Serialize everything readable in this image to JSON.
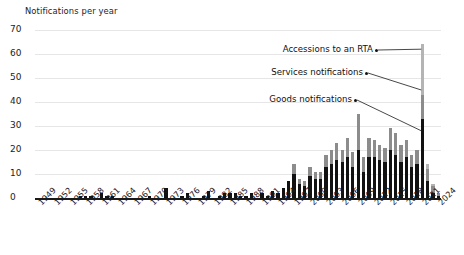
{
  "chart_data": {
    "type": "bar",
    "barmode": "stacked",
    "title": "",
    "ylabel": "Notifications per year",
    "xlabel": "",
    "ylim": [
      0,
      70
    ],
    "ytick_values": [
      0,
      10,
      20,
      30,
      40,
      50,
      60,
      70
    ],
    "grid": true,
    "legend_position": "annotations",
    "xtick_labels": [
      "1949",
      "1952",
      "1955",
      "1958",
      "1961",
      "1964",
      "1967",
      "1970",
      "1973",
      "1976",
      "1979",
      "1982",
      "1985",
      "1988",
      "1991",
      "1994",
      "1997",
      "2000",
      "2003",
      "2006",
      "2009",
      "2012",
      "2015",
      "2018",
      "2021",
      "2024"
    ],
    "xtick_step": 3,
    "x": [
      1949,
      1950,
      1951,
      1952,
      1953,
      1954,
      1955,
      1956,
      1957,
      1958,
      1959,
      1960,
      1961,
      1962,
      1963,
      1964,
      1965,
      1966,
      1967,
      1968,
      1969,
      1970,
      1971,
      1972,
      1973,
      1974,
      1975,
      1976,
      1977,
      1978,
      1979,
      1980,
      1981,
      1982,
      1983,
      1984,
      1985,
      1986,
      1987,
      1988,
      1989,
      1990,
      1991,
      1992,
      1993,
      1994,
      1995,
      1996,
      1997,
      1998,
      1999,
      2000,
      2001,
      2002,
      2003,
      2004,
      2005,
      2006,
      2007,
      2008,
      2009,
      2010,
      2011,
      2012,
      2013,
      2014,
      2015,
      2016,
      2017,
      2018,
      2019,
      2020,
      2021,
      2022,
      2023,
      2024
    ],
    "series": [
      {
        "name": "Goods notifications",
        "color": "#111111",
        "values": [
          0,
          0,
          0,
          0,
          0,
          0,
          0,
          0,
          1,
          1,
          1,
          0,
          2,
          1,
          1,
          0,
          0,
          0,
          0,
          0,
          0,
          1,
          0,
          0,
          4,
          0,
          0,
          1,
          2,
          0,
          0,
          1,
          3,
          0,
          1,
          2,
          2,
          2,
          1,
          1,
          2,
          0,
          2,
          1,
          3,
          2,
          4,
          7,
          10,
          6,
          5,
          9,
          8,
          8,
          13,
          14,
          16,
          15,
          17,
          13,
          20,
          11,
          17,
          17,
          16,
          15,
          20,
          18,
          15,
          17,
          13,
          14,
          33,
          7,
          2,
          1
        ]
      },
      {
        "name": "Services notifications",
        "color": "#8c8c8c",
        "values": [
          0,
          0,
          0,
          0,
          0,
          0,
          0,
          0,
          0,
          0,
          0,
          0,
          0,
          0,
          0,
          0,
          0,
          0,
          0,
          0,
          0,
          0,
          0,
          0,
          0,
          0,
          0,
          0,
          0,
          0,
          0,
          0,
          0,
          0,
          0,
          0,
          0,
          0,
          0,
          0,
          0,
          0,
          0,
          0,
          0,
          0,
          0,
          0,
          4,
          2,
          2,
          4,
          3,
          3,
          5,
          6,
          7,
          5,
          8,
          6,
          15,
          6,
          8,
          7,
          6,
          6,
          9,
          9,
          7,
          7,
          5,
          6,
          10,
          5,
          3,
          1
        ]
      },
      {
        "name": "Accessions to an RTA",
        "color": "#b4b4b4",
        "values": [
          0,
          0,
          0,
          0,
          0,
          0,
          0,
          0,
          0,
          0,
          0,
          0,
          0,
          0,
          0,
          0,
          0,
          0,
          0,
          0,
          0,
          0,
          0,
          0,
          0,
          0,
          0,
          0,
          0,
          0,
          0,
          0,
          0,
          0,
          0,
          0,
          0,
          0,
          0,
          0,
          0,
          0,
          0,
          0,
          0,
          0,
          0,
          0,
          0,
          0,
          0,
          0,
          0,
          0,
          0,
          0,
          0,
          0,
          0,
          0,
          0,
          0,
          0,
          0,
          0,
          0,
          0,
          0,
          0,
          0,
          0,
          0,
          21,
          2,
          1,
          0
        ]
      }
    ],
    "annotations": [
      {
        "label": "Accessions to an RTA",
        "target_year": 2021,
        "target_value": 62
      },
      {
        "label": "Services notifications",
        "target_year": 2021,
        "target_value": 45
      },
      {
        "label": "Goods notifications",
        "target_year": 2021,
        "target_value": 28
      }
    ]
  }
}
